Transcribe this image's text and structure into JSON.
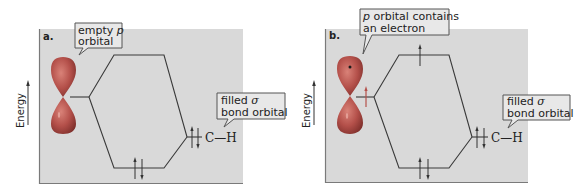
{
  "figure": {
    "panels": [
      {
        "letter": "a.",
        "axis_label": "Energy",
        "orbital_callout": {
          "line1_prefix": "empty ",
          "line1_italic": "p",
          "line2": "orbital"
        },
        "bond_callout": {
          "line1_prefix": "filled ",
          "line1_greek": "σ",
          "line2": "bond orbital"
        },
        "bond_label": "C—H",
        "p_orbital_electrons": 0,
        "upper_mo_electrons": 0,
        "lower_mo_electrons": 2,
        "ch_bond_electrons": 2
      },
      {
        "letter": "b.",
        "axis_label": "Energy",
        "orbital_callout": {
          "line1_italic": "p",
          "line1_suffix": " orbital contains",
          "line2": "an electron"
        },
        "bond_callout": {
          "line1_prefix": "filled ",
          "line1_greek": "σ",
          "line2": "bond orbital"
        },
        "bond_label": "C—H",
        "p_orbital_electrons": 1,
        "upper_mo_electrons": 1,
        "lower_mo_electrons": 2,
        "ch_bond_electrons": 2
      }
    ],
    "colors": {
      "panel_background": "#d9d9d9",
      "lobe_fill": "#b4504a",
      "lobe_highlight": "#d77a70",
      "callout_fill": "#e8e8e8",
      "line": "#3a3a3a"
    }
  }
}
